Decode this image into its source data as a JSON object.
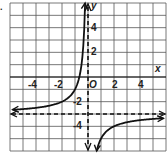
{
  "problem_marker": ".",
  "chart_data": {
    "type": "line",
    "title": "",
    "xlabel": "x",
    "ylabel": "y",
    "origin_label": "O",
    "xlim": [
      -6,
      6
    ],
    "ylim": [
      -6,
      6
    ],
    "grid": true,
    "x_tick_labels": [
      "-4",
      "-2",
      "2",
      "4"
    ],
    "y_tick_labels": [
      "4",
      "2",
      "-2",
      "-4"
    ],
    "asymptotes": {
      "vertical": 0,
      "horizontal": -3,
      "style": "dashed"
    },
    "function": "y = -2/x - 3",
    "series": [
      {
        "name": "left branch",
        "x": [
          -6,
          -4,
          -3,
          -2,
          -1.5,
          -1,
          -0.8,
          -0.6,
          -0.5,
          -0.4,
          -0.33
        ],
        "y": [
          -2.67,
          -2.5,
          -2.33,
          -2,
          -1.67,
          -1,
          -0.5,
          0.33,
          1,
          2,
          3
        ]
      },
      {
        "name": "right branch",
        "x": [
          0.33,
          0.4,
          0.5,
          0.75,
          1,
          1.5,
          2,
          3,
          4,
          6
        ],
        "y": [
          -9,
          -8,
          -7,
          -5.67,
          -5,
          -4.33,
          -4,
          -3.67,
          -3.5,
          -3.33
        ]
      }
    ],
    "colors": {
      "curve": "#111111",
      "grid": "#555555",
      "axis": "#111111"
    }
  }
}
